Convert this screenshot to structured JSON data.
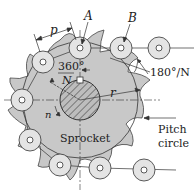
{
  "diagram": {
    "labels": {
      "pitch": "p",
      "roller_a": "A",
      "roller_b": "B",
      "angle_full": "360°",
      "angle_full_denominator": "N",
      "angle_half": "180°/N",
      "radius": "r",
      "speed": "n",
      "sprocket": "Sprocket",
      "pitch_circle_line1": "Pitch",
      "pitch_circle_line2": "circle"
    },
    "colors": {
      "sprocket_fill": "#c8c8c8",
      "roller_fill": "#e4e4e4",
      "line": "#333333",
      "background": "#ffffff"
    }
  }
}
